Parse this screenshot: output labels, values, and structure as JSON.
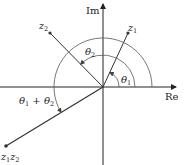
{
  "diagram": {
    "axes": {
      "real_label": "Re",
      "imag_label": "Im"
    },
    "points": {
      "z1": {
        "label_base": "z",
        "label_sub": "1"
      },
      "z2": {
        "label_base": "z",
        "label_sub": "2"
      },
      "product": {
        "label_base1": "z",
        "label_sub1": "1",
        "label_base2": "z",
        "label_sub2": "2"
      }
    },
    "angles": {
      "theta1": {
        "base": "θ",
        "sub": "1"
      },
      "theta2": {
        "base": "θ",
        "sub": "2"
      },
      "sum": {
        "base1": "θ",
        "sub1": "1",
        "op": " + ",
        "base2": "θ",
        "sub2": "2"
      }
    },
    "colors": {
      "line": "#333333",
      "arc": "#555555",
      "background": "#ffffff"
    }
  }
}
